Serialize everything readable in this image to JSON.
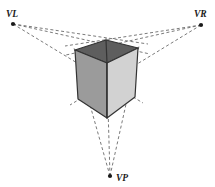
{
  "diagram": {
    "type": "perspective-construction",
    "canvas": {
      "width": 215,
      "height": 187,
      "background": "#ffffff"
    },
    "vanishing_points": [
      {
        "id": "VL",
        "label": "VL",
        "name": "vanishing-point-left",
        "x": 13,
        "y": 24,
        "label_x": 6,
        "label_y": 17,
        "marker": "dot"
      },
      {
        "id": "VR",
        "label": "VR",
        "name": "vanishing-point-right",
        "x": 201,
        "y": 25,
        "label_x": 194,
        "label_y": 17,
        "marker": "dot"
      },
      {
        "id": "VP",
        "label": "VP",
        "name": "vanishing-point-bottom",
        "x": 110,
        "y": 176,
        "label_x": 116,
        "label_y": 181,
        "marker": "dot"
      }
    ],
    "cube": {
      "name": "perspective-cube",
      "vertices": {
        "top_apex": [
          106,
          40
        ],
        "top_left": [
          75,
          50
        ],
        "top_right": [
          138,
          48
        ],
        "front_center_top": [
          107,
          63
        ],
        "bottom_left": [
          78,
          99
        ],
        "bottom_center": [
          107,
          118
        ],
        "bottom_right": [
          135,
          97
        ]
      },
      "faces": [
        {
          "name": "cube-face-top",
          "label": "top face",
          "points": "106,40 138,48 107,63 75,50",
          "fill": "#5e5e5e"
        },
        {
          "name": "cube-face-left",
          "label": "left face",
          "points": "75,50 107,63 107,118 78,99",
          "fill": "#9b9b9b"
        },
        {
          "name": "cube-face-right",
          "label": "right face",
          "points": "107,63 138,48 135,97 107,118",
          "fill": "#d2d2d2"
        }
      ],
      "edge_color": "#333333",
      "edge_width": 1.2
    },
    "construction_lines": {
      "name": "dashed-construction-lines",
      "stroke": "#6b6b6b",
      "width": 0.9,
      "dash": "3,2.4",
      "from_VL": [
        {
          "name": "vl-ray-to-top-apex",
          "x1": 13,
          "y1": 24,
          "x2": 148,
          "y2": 44
        },
        {
          "name": "vl-ray-to-top-right",
          "x1": 13,
          "y1": 24,
          "x2": 150,
          "y2": 54
        },
        {
          "name": "vl-ray-to-bottom-right",
          "x1": 13,
          "y1": 24,
          "x2": 143,
          "y2": 103
        }
      ],
      "from_VR": [
        {
          "name": "vr-ray-to-top-apex",
          "x1": 201,
          "y1": 25,
          "x2": 65,
          "y2": 46
        },
        {
          "name": "vr-ray-to-top-left",
          "x1": 201,
          "y1": 25,
          "x2": 66,
          "y2": 55
        },
        {
          "name": "vr-ray-to-bottom-left",
          "x1": 201,
          "y1": 25,
          "x2": 70,
          "y2": 105
        }
      ],
      "from_VP": [
        {
          "name": "vp-ray-to-left-edge",
          "x1": 110,
          "y1": 176,
          "x2": 74,
          "y2": 48
        },
        {
          "name": "vp-ray-to-center-edge",
          "x1": 110,
          "y1": 176,
          "x2": 106,
          "y2": 38
        },
        {
          "name": "vp-ray-to-right-edge",
          "x1": 110,
          "y1": 176,
          "x2": 139,
          "y2": 46
        }
      ]
    }
  }
}
